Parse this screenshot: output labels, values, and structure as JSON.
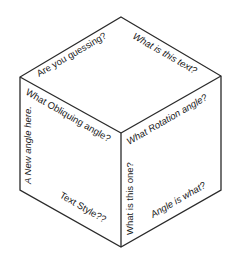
{
  "diagram": {
    "type": "isometric-cube",
    "colors": {
      "background": "#ffffff",
      "edge": "#2a2a2a",
      "text": "#1a1a1a"
    },
    "faces": {
      "top": {
        "labels": [
          {
            "text": "Are you guessing?",
            "style": "normal",
            "rotation_deg": -30
          },
          {
            "text": "What is this text?",
            "style": "italic",
            "rotation_deg": 30
          }
        ]
      },
      "left": {
        "labels": [
          {
            "text": "What Obliquing angle?",
            "style": "normal",
            "rotation_deg": 30
          },
          {
            "text": "A New angle here.",
            "style": "italic",
            "rotation_deg": -90
          },
          {
            "text": "Text Style??",
            "style": "normal",
            "rotation_deg": 30
          }
        ]
      },
      "right": {
        "labels": [
          {
            "text": "What Rotation angle?",
            "style": "italic",
            "rotation_deg": -30
          },
          {
            "text": "What is this one?",
            "style": "normal",
            "rotation_deg": -90
          },
          {
            "text": "Angle is what?",
            "style": "italic",
            "rotation_deg": -30
          }
        ]
      }
    }
  }
}
